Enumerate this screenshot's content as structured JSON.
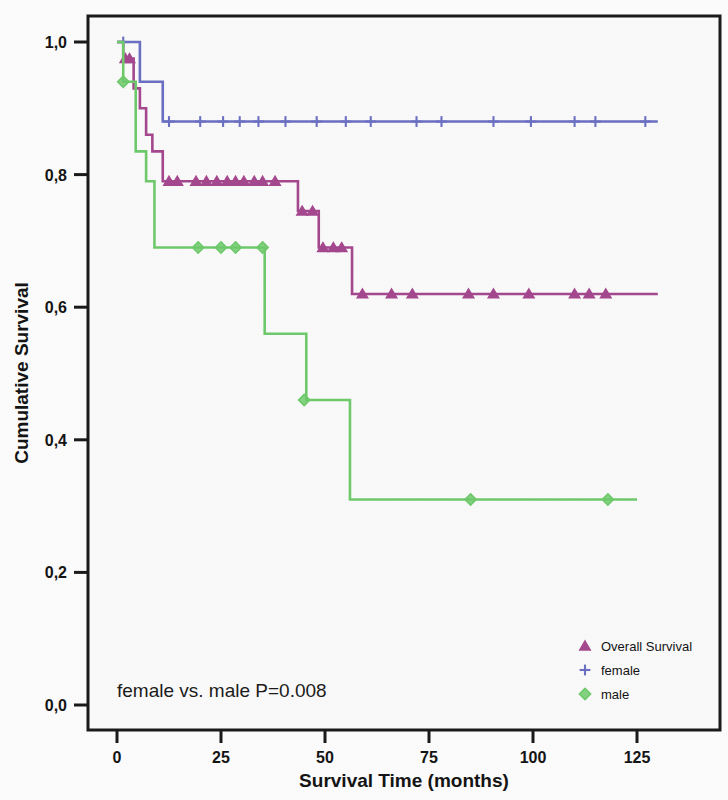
{
  "chart_data": {
    "type": "line",
    "subtype": "kaplan-meier-survival",
    "title": "",
    "xlabel": "Survival Time (months)",
    "ylabel": "Cumulative Survival",
    "xlim": [
      -3,
      134
    ],
    "ylim": [
      0.0,
      1.04
    ],
    "xticks": [
      0,
      25,
      50,
      75,
      100,
      125
    ],
    "xtick_labels": [
      "0",
      "25",
      "50",
      "75",
      "100",
      "125"
    ],
    "yticks": [
      0.0,
      0.2,
      0.4,
      0.6,
      0.8,
      1.0
    ],
    "ytick_labels": [
      "0,0",
      "0,2",
      "0,4",
      "0,6",
      "0,8",
      "1,0"
    ],
    "grid": false,
    "legend_position": "bottom-right",
    "annotation": "female vs. male P=0.008",
    "series": [
      {
        "name": "Overall Survival",
        "color": "#a5488f",
        "marker": "triangle",
        "steps": [
          [
            0.0,
            1.0
          ],
          [
            1.5,
            1.0
          ],
          [
            1.5,
            0.975
          ],
          [
            4.0,
            0.975
          ],
          [
            4.0,
            0.93
          ],
          [
            5.5,
            0.93
          ],
          [
            5.5,
            0.9
          ],
          [
            7.0,
            0.9
          ],
          [
            7.0,
            0.86
          ],
          [
            8.5,
            0.86
          ],
          [
            8.5,
            0.835
          ],
          [
            11.0,
            0.835
          ],
          [
            11.0,
            0.79
          ],
          [
            43.5,
            0.79
          ],
          [
            43.5,
            0.745
          ],
          [
            48.5,
            0.745
          ],
          [
            48.5,
            0.69
          ],
          [
            56.5,
            0.69
          ],
          [
            56.5,
            0.62
          ],
          [
            130.0,
            0.62
          ]
        ],
        "censor_points": [
          [
            2.0,
            0.975
          ],
          [
            3.0,
            0.975
          ],
          [
            12.5,
            0.79
          ],
          [
            14.5,
            0.79
          ],
          [
            19.0,
            0.79
          ],
          [
            21.5,
            0.79
          ],
          [
            24.0,
            0.79
          ],
          [
            26.5,
            0.79
          ],
          [
            28.5,
            0.79
          ],
          [
            30.5,
            0.79
          ],
          [
            33.0,
            0.79
          ],
          [
            35.0,
            0.79
          ],
          [
            38.0,
            0.79
          ],
          [
            44.5,
            0.745
          ],
          [
            47.0,
            0.745
          ],
          [
            49.5,
            0.69
          ],
          [
            52.0,
            0.69
          ],
          [
            54.0,
            0.69
          ],
          [
            59.0,
            0.62
          ],
          [
            66.0,
            0.62
          ],
          [
            71.0,
            0.62
          ],
          [
            84.5,
            0.62
          ],
          [
            90.5,
            0.62
          ],
          [
            99.0,
            0.62
          ],
          [
            110.0,
            0.62
          ],
          [
            113.5,
            0.62
          ],
          [
            117.5,
            0.62
          ]
        ]
      },
      {
        "name": "female",
        "color": "#6b70c4",
        "marker": "plus",
        "steps": [
          [
            0.0,
            1.0
          ],
          [
            5.5,
            1.0
          ],
          [
            5.5,
            0.94
          ],
          [
            11.0,
            0.94
          ],
          [
            11.0,
            0.88
          ],
          [
            130.0,
            0.88
          ]
        ],
        "censor_points": [
          [
            1.5,
            1.0
          ],
          [
            12.5,
            0.88
          ],
          [
            20.0,
            0.88
          ],
          [
            25.5,
            0.88
          ],
          [
            29.5,
            0.88
          ],
          [
            34.0,
            0.88
          ],
          [
            40.5,
            0.88
          ],
          [
            48.0,
            0.88
          ],
          [
            55.0,
            0.88
          ],
          [
            61.0,
            0.88
          ],
          [
            72.0,
            0.88
          ],
          [
            78.0,
            0.88
          ],
          [
            90.5,
            0.88
          ],
          [
            99.5,
            0.88
          ],
          [
            110.0,
            0.88
          ],
          [
            115.0,
            0.88
          ],
          [
            127.0,
            0.88
          ]
        ]
      },
      {
        "name": "male",
        "color": "#6fcb6c",
        "marker": "diamond",
        "steps": [
          [
            0.0,
            1.0
          ],
          [
            1.5,
            1.0
          ],
          [
            1.5,
            0.94
          ],
          [
            4.5,
            0.94
          ],
          [
            4.5,
            0.835
          ],
          [
            7.0,
            0.835
          ],
          [
            7.0,
            0.79
          ],
          [
            9.0,
            0.79
          ],
          [
            9.0,
            0.69
          ],
          [
            35.5,
            0.69
          ],
          [
            35.5,
            0.56
          ],
          [
            45.5,
            0.56
          ],
          [
            45.5,
            0.46
          ],
          [
            56.0,
            0.46
          ],
          [
            56.0,
            0.31
          ],
          [
            125.0,
            0.31
          ]
        ],
        "censor_points": [
          [
            1.5,
            0.94
          ],
          [
            19.5,
            0.69
          ],
          [
            25.0,
            0.69
          ],
          [
            28.5,
            0.69
          ],
          [
            35.0,
            0.69
          ],
          [
            45.0,
            0.46
          ],
          [
            85.0,
            0.31
          ],
          [
            118.0,
            0.31
          ]
        ]
      }
    ]
  },
  "legend": {
    "entries": [
      {
        "label": "Overall Survival",
        "marker": "triangle-icon",
        "color": "#a5488f"
      },
      {
        "label": "female",
        "marker": "plus-icon",
        "color": "#6b70c4"
      },
      {
        "label": "male",
        "marker": "diamond-icon",
        "color": "#6fcb6c"
      }
    ]
  }
}
